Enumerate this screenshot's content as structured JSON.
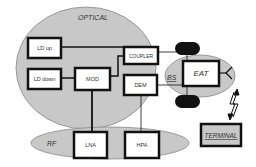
{
  "diagram": {
    "regions": {
      "optical": "OPTICAL",
      "rf": "RF",
      "bs": "BS"
    },
    "blocks": {
      "ld_up": "LD up",
      "ld_down": "LD down",
      "mod": "MOD",
      "coupler": "COUPLER",
      "dem": "DEM",
      "lna": "LNA",
      "hpa": "HPA",
      "eat": "EAT",
      "terminal": "TERMINAL"
    },
    "colors": {
      "region_fill": "#c8c8c8",
      "block_border": "#111111",
      "block_fill": "#ffffff",
      "terminal_fill": "#c8c8c8",
      "pill_fill": "#111111"
    }
  }
}
